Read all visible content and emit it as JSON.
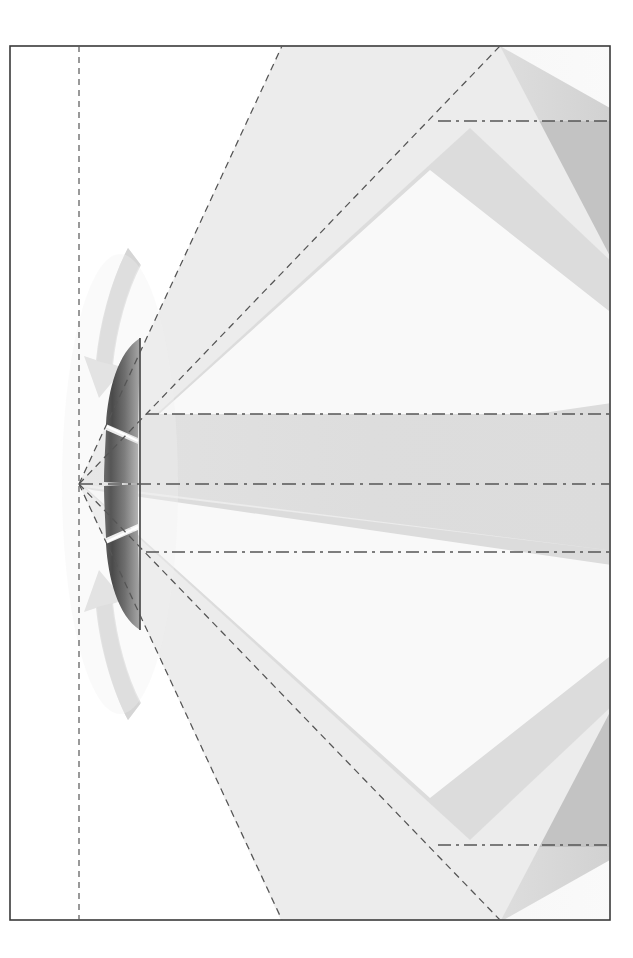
{
  "figure": {
    "background_color": "#ffffff",
    "frame": {
      "name": "drawing-frame",
      "x": 10,
      "y": 46,
      "width": 600,
      "height": 874,
      "stroke_color": "#3a3a3a",
      "stroke_width": 1.6,
      "fill_color": "#ffffff"
    },
    "axis_vertical": {
      "name": "aperture-plane-axis",
      "x": 79,
      "y_start": 46,
      "y_end": 920,
      "stroke_color": "#555555",
      "dash": "6 5",
      "stroke_width": 1.2
    },
    "axis_horizontal": {
      "name": "boresight-axis",
      "y": 484,
      "x_start": 79,
      "x_end": 610,
      "stroke_color": "#555555",
      "dash": "14 6 3 6",
      "stroke_width": 1.3
    },
    "apex": {
      "x": 79,
      "y": 484
    },
    "colors": {
      "lobe_light": "#eeeeee",
      "lobe_mid": "#d7d7d7",
      "lobe_dark": "#bcbcbc",
      "lobe_white": "#fdfdfd",
      "main_lobe_fill": "#dedede",
      "reflector_dark": "#4a4a4a",
      "reflector_mid": "#7d7d7d",
      "reflector_light": "#b9b9b9",
      "arrow_gray": "#d5d5d5",
      "dash_stroke": "#555555",
      "frame_stroke": "#3a3a3a"
    },
    "reflector": {
      "name": "reflector-antenna-panel",
      "top_y": 338,
      "bottom_y": 630,
      "front_x": 106,
      "back_x": 140,
      "split_gap": "white seam at mid-panel",
      "segments": 2
    },
    "main_lobe": {
      "name": "main-lobe",
      "upper_edge_y_at_right": 414,
      "lower_edge_y_at_right": 552,
      "apex_x": 79,
      "apex_y": 484,
      "fill": "#dedede",
      "boundary_dash": "10 6"
    },
    "side_lobes_upper": [
      {
        "name": "upper-inner-sidelobe",
        "edge_top_y_at_right": 280,
        "edge_bottom_y_at_right": 414
      },
      {
        "name": "upper-outer-sidelobe",
        "edge_top_y_at_right": 121,
        "edge_bottom_y_at_right": 280
      }
    ],
    "side_lobes_lower": [
      {
        "name": "lower-inner-sidelobe",
        "edge_top_y_at_right": 552,
        "edge_bottom_y_at_right": 690
      },
      {
        "name": "lower-outer-sidelobe",
        "edge_top_y_at_right": 690,
        "edge_bottom_y_at_right": 845
      }
    ],
    "boundary_lines": {
      "upper_outer_dashed": {
        "name": "upper-outer-boundary",
        "from_x": 79,
        "from_y": 484,
        "to_x": 282,
        "to_y": 46
      },
      "upper_inner_dashed": {
        "name": "upper-inner-boundary",
        "from_x": 79,
        "from_y": 484,
        "to_x": 500,
        "to_y": 46
      },
      "lower_outer_dashed": {
        "name": "lower-outer-boundary",
        "from_x": 79,
        "from_y": 484,
        "to_x": 282,
        "to_y": 920
      },
      "lower_inner_dashed": {
        "name": "lower-inner-boundary",
        "from_x": 79,
        "from_y": 484,
        "to_x": 500,
        "to_y": 920
      }
    },
    "dash_dot_lines": [
      {
        "name": "upper-sidelobe-level-line",
        "y": 121,
        "x_start": 438,
        "x_end": 610
      },
      {
        "name": "main-lobe-upper-level-line",
        "y": 414,
        "x_start": 146,
        "x_end": 610
      },
      {
        "name": "main-lobe-lower-level-line",
        "y": 552,
        "x_start": 146,
        "x_end": 610
      },
      {
        "name": "lower-sidelobe-level-line",
        "y": 845,
        "x_start": 438,
        "x_end": 610
      }
    ],
    "back_arrows": [
      {
        "name": "upper-back-radiation-arrow",
        "orientation": "upper-left-curve"
      },
      {
        "name": "lower-back-radiation-arrow",
        "orientation": "lower-left-curve"
      }
    ]
  }
}
